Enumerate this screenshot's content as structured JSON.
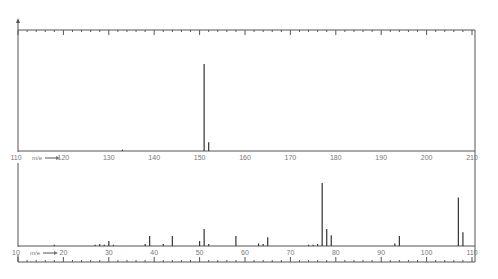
{
  "chart_data": [
    {
      "type": "bar",
      "title": "",
      "xlabel": "m/e",
      "ylabel": "",
      "xlim": [
        110,
        210
      ],
      "x_ticks": [
        110,
        120,
        130,
        140,
        150,
        160,
        170,
        180,
        190,
        200,
        210
      ],
      "peaks": [
        {
          "mz": 133,
          "intensity": 1.5
        },
        {
          "mz": 151,
          "intensity": 100
        },
        {
          "mz": 152,
          "intensity": 10
        }
      ]
    },
    {
      "type": "bar",
      "title": "",
      "xlabel": "m/e",
      "ylabel": "",
      "xlim": [
        10,
        110
      ],
      "x_ticks": [
        10,
        20,
        30,
        40,
        50,
        60,
        70,
        80,
        90,
        100,
        110
      ],
      "peaks": [
        {
          "mz": 18,
          "intensity": 2
        },
        {
          "mz": 27,
          "intensity": 2
        },
        {
          "mz": 28,
          "intensity": 3
        },
        {
          "mz": 29,
          "intensity": 2
        },
        {
          "mz": 30,
          "intensity": 8
        },
        {
          "mz": 31,
          "intensity": 2
        },
        {
          "mz": 38,
          "intensity": 3
        },
        {
          "mz": 39,
          "intensity": 16
        },
        {
          "mz": 42,
          "intensity": 3
        },
        {
          "mz": 44,
          "intensity": 16
        },
        {
          "mz": 50,
          "intensity": 8
        },
        {
          "mz": 51,
          "intensity": 27
        },
        {
          "mz": 52,
          "intensity": 3
        },
        {
          "mz": 58,
          "intensity": 16
        },
        {
          "mz": 63,
          "intensity": 4
        },
        {
          "mz": 64,
          "intensity": 3
        },
        {
          "mz": 65,
          "intensity": 14
        },
        {
          "mz": 74,
          "intensity": 2
        },
        {
          "mz": 75,
          "intensity": 2
        },
        {
          "mz": 76,
          "intensity": 3
        },
        {
          "mz": 77,
          "intensity": 100
        },
        {
          "mz": 78,
          "intensity": 27
        },
        {
          "mz": 79,
          "intensity": 17
        },
        {
          "mz": 93,
          "intensity": 4
        },
        {
          "mz": 94,
          "intensity": 16
        },
        {
          "mz": 107,
          "intensity": 77
        },
        {
          "mz": 108,
          "intensity": 22
        }
      ]
    }
  ],
  "labels": {
    "upper_mz": "m/e",
    "lower_mz": "m/e",
    "upper_ticks": [
      "110",
      "120",
      "130",
      "140",
      "150",
      "160",
      "170",
      "180",
      "190",
      "200",
      "210"
    ],
    "lower_ticks": [
      "10",
      "20",
      "30",
      "40",
      "50",
      "60",
      "70",
      "80",
      "90",
      "100",
      "110"
    ]
  }
}
